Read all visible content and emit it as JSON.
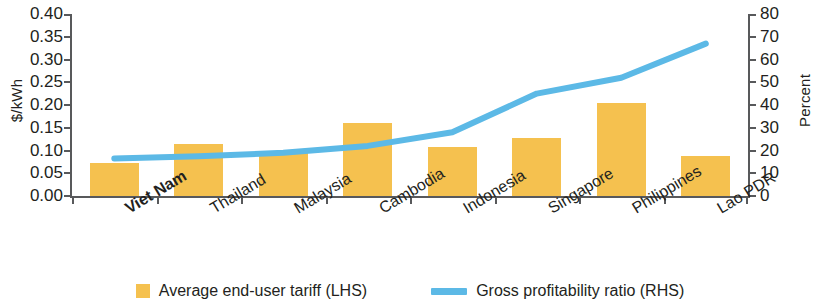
{
  "chart_data": {
    "type": "bar",
    "title": "",
    "subtitle": "",
    "categories": [
      "Viet Nam",
      "Thailand",
      "Malaysia",
      "Cambodia",
      "Indonesia",
      "Singapore",
      "Philippines",
      "Lao PDR"
    ],
    "highlighted_category": "Viet Nam",
    "series": [
      {
        "name": "Average end-user tariff (LHS)",
        "type": "bar",
        "axis": "left",
        "unit": "$/kWh",
        "color": "#f5c14f",
        "values": [
          0.073,
          0.115,
          0.098,
          0.16,
          0.108,
          0.128,
          0.205,
          0.088
        ]
      },
      {
        "name": "Gross profitability ratio (RHS)",
        "type": "line",
        "axis": "right",
        "unit": "Percent",
        "color": "#5cb9e6",
        "values": [
          16.5,
          17.5,
          19.0,
          22.0,
          28.0,
          45.0,
          52.0,
          67.0
        ]
      }
    ],
    "xlabel": "",
    "ylabel": "$/kWh",
    "y2label": "Percent",
    "ylim": [
      0,
      0.4
    ],
    "y2lim": [
      0,
      80
    ],
    "yticks": [
      "0.00",
      "0.05",
      "0.10",
      "0.15",
      "0.20",
      "0.25",
      "0.30",
      "0.35",
      "0.40"
    ],
    "ytick_values": [
      0,
      0.05,
      0.1,
      0.15,
      0.2,
      0.25,
      0.3,
      0.35,
      0.4
    ],
    "y2ticks": [
      "0",
      "10",
      "20",
      "30",
      "40",
      "50",
      "60",
      "70",
      "80"
    ],
    "y2tick_values": [
      0,
      10,
      20,
      30,
      40,
      50,
      60,
      70,
      80
    ],
    "grid": false,
    "legend_position": "bottom"
  },
  "legend": {
    "items": [
      {
        "label": "Average end-user tariff (LHS)",
        "marker": "square",
        "color": "#f5c14f"
      },
      {
        "label": "Gross profitability ratio (RHS)",
        "marker": "line",
        "color": "#5cb9e6"
      }
    ]
  }
}
